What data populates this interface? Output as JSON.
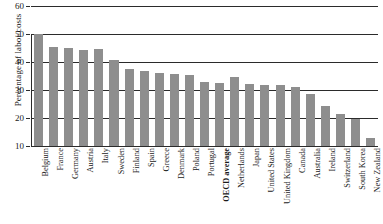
{
  "chart_data": {
    "type": "bar",
    "title": "",
    "xlabel": "",
    "ylabel": "Percentage of labor costs",
    "ylim": [
      10,
      60
    ],
    "yticks": [
      10,
      20,
      30,
      40,
      50,
      60
    ],
    "ytick_labels": [
      "10",
      "20",
      "30",
      "40",
      "50",
      "60"
    ],
    "grid": true,
    "legend": "none",
    "bar_color": "#8e8e8e",
    "axis_color": "#2b2b2b",
    "highlight_category": "OECD average",
    "categories": [
      "Belgium",
      "France",
      "Germany",
      "Austria",
      "Italy",
      "Sweden",
      "Finland",
      "Spain",
      "Greece",
      "Denmark",
      "Poland",
      "Portugal",
      "OECD average",
      "Netherlands",
      "Japan",
      "United States",
      "United Kingdom",
      "Canada",
      "Australia",
      "Ireland",
      "Switzerland",
      "South Korea",
      "New Zealand"
    ],
    "values": [
      50.0,
      45.3,
      45.0,
      44.2,
      44.5,
      40.6,
      37.5,
      36.8,
      35.9,
      35.6,
      35.2,
      32.9,
      32.5,
      34.5,
      32.0,
      31.9,
      31.8,
      31.0,
      28.6,
      24.4,
      21.3,
      19.6,
      13.0
    ]
  }
}
